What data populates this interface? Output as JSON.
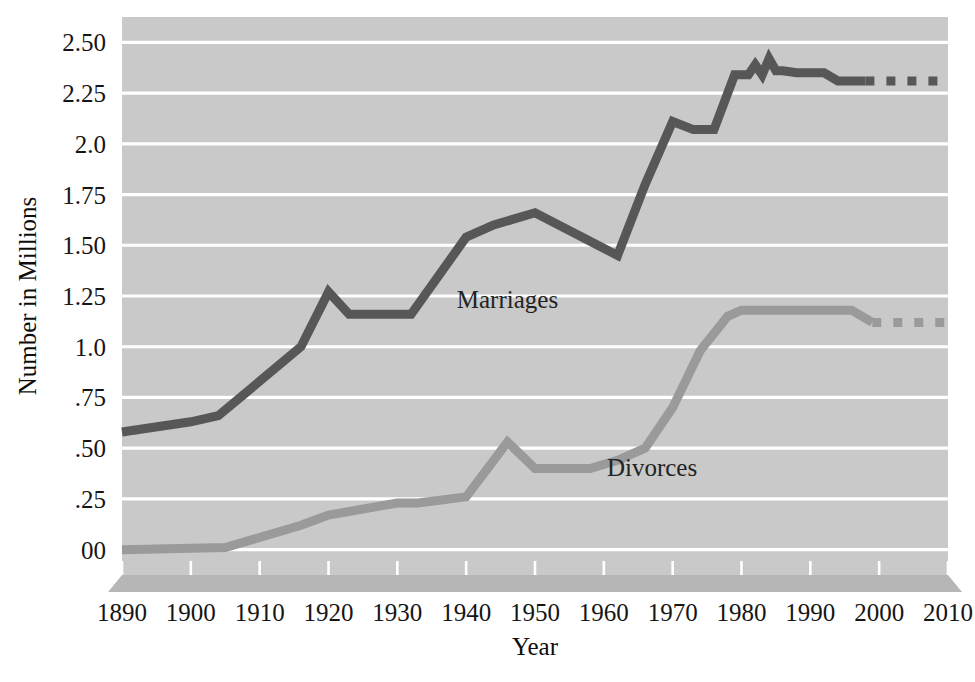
{
  "chart_data": {
    "type": "line",
    "title": "",
    "xlabel": "Year",
    "ylabel": "Number in Millions",
    "xlim": [
      1890,
      2010
    ],
    "ylim": [
      -0.125,
      2.625
    ],
    "grid": true,
    "grid_axis": "y",
    "legend": "inline-labels",
    "background_color": "#c9c9c9",
    "gridline_color": "#ffffff",
    "x_ticks": [
      1890,
      1900,
      1910,
      1920,
      1930,
      1940,
      1950,
      1960,
      1970,
      1980,
      1990,
      2000,
      2010
    ],
    "x_tick_labels": [
      "1890",
      "1900",
      "1910",
      "1920",
      "1930",
      "1940",
      "1950",
      "1960",
      "1970",
      "1980",
      "1990",
      "2000",
      "2010"
    ],
    "y_ticks": [
      2.5,
      2.25,
      2.0,
      1.75,
      1.5,
      1.25,
      1.0,
      0.75,
      0.5,
      0.25,
      0.0
    ],
    "y_tick_labels": [
      "2.50",
      "2.25",
      "2.0",
      "1.75",
      "1.50",
      "1.25",
      "1.0",
      ".75",
      ".50",
      ".25",
      "00"
    ],
    "series": [
      {
        "name": "Marriages",
        "color": "#575757",
        "label_x": 1946,
        "label_y": 1.19,
        "solid": {
          "x": [
            1890,
            1900,
            1904,
            1916,
            1920,
            1923,
            1932,
            1940,
            1944,
            1950,
            1958,
            1962,
            1966,
            1970,
            1973,
            1976,
            1979,
            1981,
            1982,
            1983,
            1984,
            1985,
            1986,
            1988,
            1992,
            1994,
            1998
          ],
          "y": [
            0.58,
            0.63,
            0.66,
            1.0,
            1.27,
            1.16,
            1.16,
            1.54,
            1.6,
            1.66,
            1.52,
            1.45,
            1.8,
            2.11,
            2.07,
            2.07,
            2.34,
            2.34,
            2.39,
            2.34,
            2.42,
            2.36,
            2.36,
            2.35,
            2.35,
            2.31,
            2.31
          ]
        },
        "dashed": {
          "x": [
            1998,
            2010
          ],
          "y": [
            2.31,
            2.31
          ]
        }
      },
      {
        "name": "Divorces",
        "color": "#9a9a9a",
        "label_x": 1967,
        "label_y": 0.365,
        "solid": {
          "x": [
            1890,
            1905,
            1916,
            1920,
            1930,
            1933,
            1940,
            1946,
            1950,
            1958,
            1962,
            1966,
            1970,
            1974,
            1978,
            1980,
            1996,
            1999
          ],
          "y": [
            0.0,
            0.01,
            0.12,
            0.17,
            0.23,
            0.23,
            0.26,
            0.53,
            0.4,
            0.4,
            0.44,
            0.5,
            0.7,
            0.98,
            1.15,
            1.18,
            1.18,
            1.12
          ]
        },
        "dashed": {
          "x": [
            1999,
            2010
          ],
          "y": [
            1.12,
            1.12
          ]
        }
      }
    ]
  },
  "axes": {
    "x_title": "Year",
    "y_title": "Number in Millions"
  }
}
